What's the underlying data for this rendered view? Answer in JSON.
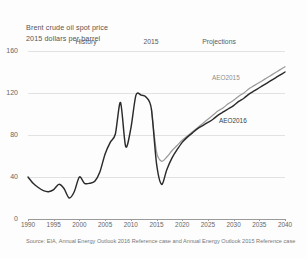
{
  "title": {
    "line1": "Brent crude oil spot price",
    "line2": "2015 dollars per barrel"
  },
  "annotations": {
    "history": "History",
    "split_year": "2015",
    "projections": "Projections"
  },
  "series_labels": {
    "aeo2015": "AEO2015",
    "aeo2016": "AEO2016"
  },
  "source": "Source: EIA, Annual Energy Outlook 2016 Reference case and Annual Energy Outlook 2015 Reference case",
  "colors": {
    "aeo2016": "#2b2b2b",
    "aeo2015": "#9b9b9b",
    "grid": "#e2e2e2",
    "axis": "#9a9a9a",
    "text": "#666666"
  },
  "chart_data": {
    "type": "line",
    "title": "Brent crude oil spot price",
    "subtitle": "2015 dollars per barrel",
    "xlabel": "",
    "ylabel": "2015 dollars per barrel",
    "xlim": [
      1990,
      2040
    ],
    "ylim": [
      0,
      160
    ],
    "yticks": [
      0,
      40,
      80,
      120,
      160
    ],
    "xticks": [
      1990,
      1995,
      2000,
      2005,
      2010,
      2015,
      2020,
      2025,
      2030,
      2035,
      2040
    ],
    "grid": true,
    "legend": "inline-labels",
    "history_end_year": 2015,
    "series": [
      {
        "name": "AEO2016",
        "color": "#2b2b2b",
        "x": [
          1990,
          1991,
          1992,
          1993,
          1994,
          1995,
          1996,
          1997,
          1998,
          1999,
          2000,
          2001,
          2002,
          2003,
          2004,
          2005,
          2006,
          2007,
          2008,
          2009,
          2010,
          2011,
          2012,
          2013,
          2014,
          2015,
          2016,
          2017,
          2018,
          2019,
          2020,
          2021,
          2022,
          2023,
          2024,
          2025,
          2026,
          2027,
          2028,
          2029,
          2030,
          2031,
          2032,
          2033,
          2034,
          2035,
          2036,
          2037,
          2038,
          2039,
          2040
        ],
        "values": [
          40,
          34,
          30,
          27,
          26,
          28,
          33,
          29,
          20,
          26,
          40,
          34,
          34,
          36,
          45,
          62,
          73,
          81,
          111,
          69,
          86,
          118,
          118,
          116,
          105,
          53,
          33,
          47,
          58,
          66,
          73,
          78,
          82,
          86,
          89,
          92,
          95,
          99,
          102,
          105,
          108,
          112,
          115,
          119,
          122,
          125,
          128,
          131,
          134,
          137,
          140
        ]
      },
      {
        "name": "AEO2015",
        "color": "#9b9b9b",
        "x": [
          2014,
          2015,
          2016,
          2017,
          2018,
          2019,
          2020,
          2021,
          2022,
          2023,
          2024,
          2025,
          2026,
          2027,
          2028,
          2029,
          2030,
          2031,
          2032,
          2033,
          2034,
          2035,
          2036,
          2037,
          2038,
          2039,
          2040
        ],
        "values": [
          105,
          64,
          55,
          59,
          65,
          70,
          75,
          79,
          83,
          87,
          91,
          95,
          99,
          103,
          106,
          110,
          113,
          117,
          120,
          124,
          127,
          130,
          133,
          136,
          139,
          142,
          145
        ]
      }
    ]
  }
}
